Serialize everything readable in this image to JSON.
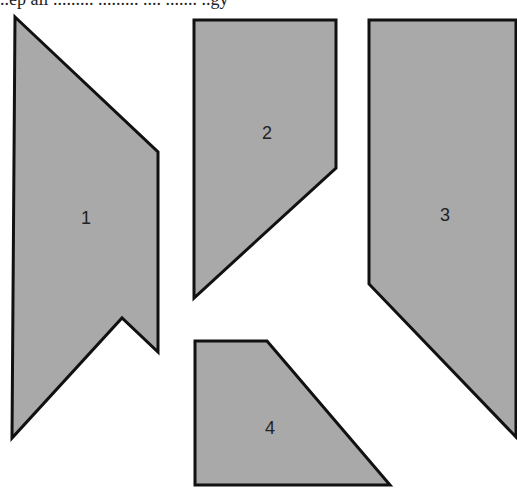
{
  "header": {
    "cropped_text": "..ep all ......... ......... .... ....... ..gy"
  },
  "diagram": {
    "fill_color": "#a9a9a9",
    "stroke_color": "#111111",
    "pieces": [
      {
        "id": "1",
        "label": "1",
        "points": "15,17 158,152 158,352 122,318 12,438",
        "label_x": 86,
        "label_y": 219
      },
      {
        "id": "2",
        "label": "2",
        "points": "194,20 336,20 336,168 194,298",
        "label_x": 267,
        "label_y": 134
      },
      {
        "id": "3",
        "label": "3",
        "points": "369,20 516,20 516,437 369,284",
        "label_x": 445,
        "label_y": 216
      },
      {
        "id": "4",
        "label": "4",
        "points": "195,341 267,341 390,485 195,485",
        "label_x": 270,
        "label_y": 429
      }
    ]
  }
}
